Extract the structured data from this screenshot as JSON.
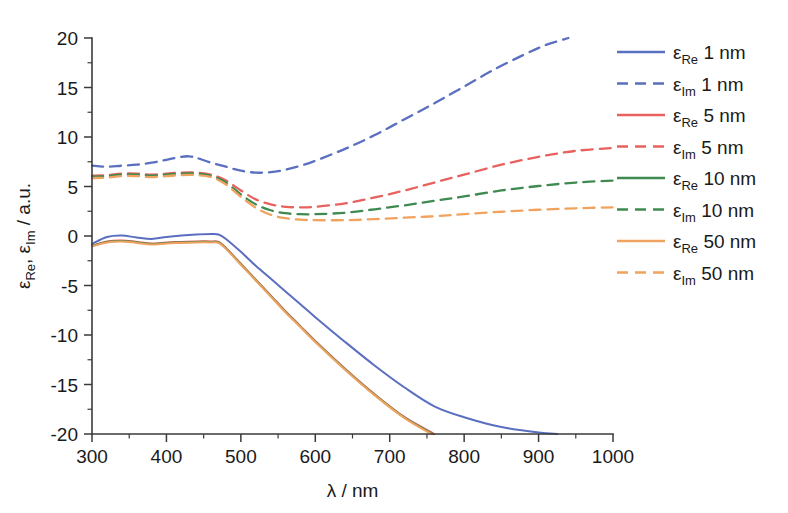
{
  "chart_data": {
    "type": "line",
    "title": "",
    "xlabel": "λ / nm",
    "ylabel": "ε_Re, ε_Im / a.u.",
    "xlabel_parts": {
      "symbol": "λ",
      "unit": "/ nm"
    },
    "ylabel_parts": {
      "sym1": "ε",
      "sub1": "Re",
      "sep": ", ",
      "sym2": "ε",
      "sub2": "Im",
      "unit": " / a.u."
    },
    "xlim": [
      300,
      1000
    ],
    "ylim": [
      -20,
      20
    ],
    "xticks": [
      300,
      400,
      500,
      600,
      700,
      800,
      900,
      1000
    ],
    "yticks": [
      20,
      15,
      10,
      5,
      0,
      -5,
      -10,
      -15,
      -20
    ],
    "xtick_labels": [
      "300",
      "400",
      "500",
      "600",
      "700",
      "800",
      "900",
      "1000"
    ],
    "ytick_labels": [
      "20",
      "15",
      "10",
      "5",
      "0",
      "-5",
      "-10",
      "-15",
      "-20"
    ],
    "xminor_step": 50,
    "yminor_step": 2.5,
    "grid": false,
    "legend_position": "right",
    "colors": {
      "blue": "#5a6fc0",
      "red": "#e8615e",
      "green": "#3f8a50",
      "orange": "#f0a35e"
    },
    "series": [
      {
        "name": "ε_Re 1 nm",
        "legend_sym": "ε",
        "legend_sub": "Re",
        "legend_rest": "1 nm",
        "color_key": "blue",
        "color": "#5a6fc0",
        "style": "solid",
        "x": [
          300,
          320,
          340,
          360,
          380,
          400,
          420,
          440,
          460,
          470,
          480,
          500,
          520,
          540,
          560,
          580,
          600,
          640,
          680,
          720,
          760,
          800,
          850,
          900,
          925
        ],
        "y": [
          -0.8,
          -0.1,
          0.05,
          -0.15,
          -0.3,
          -0.1,
          0.05,
          0.15,
          0.2,
          0.15,
          -0.3,
          -1.6,
          -3.0,
          -4.3,
          -5.6,
          -6.9,
          -8.2,
          -10.7,
          -13.1,
          -15.3,
          -17.2,
          -18.3,
          -19.3,
          -19.85,
          -20.0
        ]
      },
      {
        "name": "ε_Im 1 nm",
        "legend_sym": "ε",
        "legend_sub": "Im",
        "legend_rest": "1 nm",
        "color_key": "blue",
        "color": "#5a6fc0",
        "style": "dashed",
        "x": [
          300,
          320,
          340,
          360,
          380,
          400,
          420,
          430,
          440,
          460,
          480,
          500,
          520,
          540,
          560,
          580,
          600,
          640,
          680,
          720,
          760,
          800,
          840,
          880,
          910,
          940
        ],
        "y": [
          7.1,
          7.0,
          7.1,
          7.2,
          7.4,
          7.7,
          8.0,
          8.05,
          7.9,
          7.4,
          7.0,
          6.6,
          6.4,
          6.45,
          6.7,
          7.1,
          7.6,
          8.8,
          10.2,
          11.8,
          13.4,
          15.1,
          16.8,
          18.3,
          19.3,
          20.0
        ]
      },
      {
        "name": "ε_Re 5 nm",
        "legend_sym": "ε",
        "legend_sub": "Re",
        "legend_rest": "5 nm",
        "color_key": "red",
        "color": "#e8615e",
        "style": "solid",
        "x": [
          300,
          320,
          340,
          360,
          380,
          400,
          420,
          440,
          460,
          470,
          480,
          500,
          520,
          540,
          560,
          580,
          600,
          640,
          680,
          720,
          760
        ],
        "y": [
          -1.0,
          -0.55,
          -0.45,
          -0.6,
          -0.75,
          -0.65,
          -0.6,
          -0.55,
          -0.55,
          -0.6,
          -1.2,
          -2.8,
          -4.4,
          -6.0,
          -7.6,
          -9.1,
          -10.6,
          -13.4,
          -16.0,
          -18.3,
          -20.0
        ]
      },
      {
        "name": "ε_Im 5 nm",
        "legend_sym": "ε",
        "legend_sub": "Im",
        "legend_rest": "5 nm",
        "color_key": "red",
        "color": "#e8615e",
        "style": "dashed",
        "x": [
          300,
          320,
          340,
          360,
          380,
          400,
          420,
          440,
          460,
          480,
          500,
          520,
          540,
          560,
          580,
          600,
          640,
          680,
          720,
          760,
          800,
          850,
          900,
          950,
          1000
        ],
        "y": [
          6.1,
          6.15,
          6.3,
          6.3,
          6.2,
          6.3,
          6.4,
          6.4,
          6.2,
          5.6,
          4.6,
          3.7,
          3.2,
          2.95,
          2.9,
          2.95,
          3.3,
          3.9,
          4.6,
          5.4,
          6.2,
          7.2,
          8.0,
          8.6,
          8.9
        ]
      },
      {
        "name": "ε_Re 10 nm",
        "legend_sym": "ε",
        "legend_sub": "Re",
        "legend_rest": "10 nm",
        "color_key": "green",
        "color": "#3f8a50",
        "style": "solid",
        "x": [
          300,
          320,
          340,
          360,
          380,
          400,
          420,
          440,
          460,
          470,
          480,
          500,
          520,
          540,
          560,
          580,
          600,
          640,
          680,
          720,
          758
        ],
        "y": [
          -1.0,
          -0.6,
          -0.5,
          -0.65,
          -0.8,
          -0.7,
          -0.65,
          -0.6,
          -0.6,
          -0.65,
          -1.25,
          -2.85,
          -4.45,
          -6.05,
          -7.65,
          -9.15,
          -10.65,
          -13.45,
          -16.05,
          -18.35,
          -20.0
        ]
      },
      {
        "name": "ε_Im 10 nm",
        "legend_sym": "ε",
        "legend_sub": "Im",
        "legend_rest": "10 nm",
        "color_key": "green",
        "color": "#3f8a50",
        "style": "dashed",
        "x": [
          300,
          320,
          340,
          360,
          380,
          400,
          420,
          440,
          460,
          480,
          500,
          520,
          540,
          560,
          580,
          600,
          640,
          680,
          720,
          760,
          800,
          850,
          900,
          950,
          1000
        ],
        "y": [
          6.0,
          6.05,
          6.2,
          6.2,
          6.1,
          6.2,
          6.3,
          6.3,
          6.1,
          5.4,
          4.2,
          3.2,
          2.6,
          2.3,
          2.2,
          2.2,
          2.35,
          2.7,
          3.1,
          3.55,
          4.0,
          4.6,
          5.05,
          5.4,
          5.6
        ]
      },
      {
        "name": "ε_Re 50 nm",
        "legend_sym": "ε",
        "legend_sub": "Re",
        "legend_rest": "50 nm",
        "color_key": "orange",
        "color": "#f0a35e",
        "style": "solid",
        "x": [
          300,
          320,
          340,
          360,
          380,
          400,
          420,
          440,
          460,
          470,
          480,
          500,
          520,
          540,
          560,
          580,
          600,
          640,
          680,
          720,
          756
        ],
        "y": [
          -1.05,
          -0.65,
          -0.55,
          -0.7,
          -0.85,
          -0.75,
          -0.7,
          -0.65,
          -0.65,
          -0.7,
          -1.3,
          -2.9,
          -4.5,
          -6.1,
          -7.7,
          -9.2,
          -10.7,
          -13.5,
          -16.1,
          -18.4,
          -20.0
        ]
      },
      {
        "name": "ε_Im 50 nm",
        "legend_sym": "ε",
        "legend_sub": "Im",
        "legend_rest": "50 nm",
        "color_key": "orange",
        "color": "#f0a35e",
        "style": "dashed",
        "x": [
          300,
          320,
          340,
          360,
          380,
          400,
          420,
          440,
          460,
          480,
          500,
          520,
          540,
          560,
          580,
          600,
          640,
          680,
          720,
          760,
          800,
          850,
          900,
          950,
          1000
        ],
        "y": [
          5.85,
          5.9,
          6.05,
          6.05,
          5.95,
          6.05,
          6.15,
          6.15,
          5.95,
          5.2,
          3.95,
          2.85,
          2.15,
          1.8,
          1.65,
          1.6,
          1.6,
          1.7,
          1.85,
          2.0,
          2.2,
          2.45,
          2.65,
          2.8,
          2.9
        ]
      }
    ]
  },
  "legend": {
    "entries": [
      {
        "sym": "ε",
        "sub": "Re",
        "rest": "1 nm"
      },
      {
        "sym": "ε",
        "sub": "Im",
        "rest": "1 nm"
      },
      {
        "sym": "ε",
        "sub": "Re",
        "rest": "5 nm"
      },
      {
        "sym": "ε",
        "sub": "Im",
        "rest": "5 nm"
      },
      {
        "sym": "ε",
        "sub": "Re",
        "rest": "10 nm"
      },
      {
        "sym": "ε",
        "sub": "Im",
        "rest": "10 nm"
      },
      {
        "sym": "ε",
        "sub": "Re",
        "rest": "50 nm"
      },
      {
        "sym": "ε",
        "sub": "Im",
        "rest": "50 nm"
      }
    ]
  }
}
